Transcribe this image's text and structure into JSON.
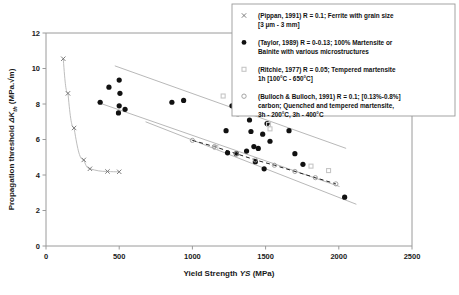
{
  "chart_data": {
    "type": "scatter",
    "title": "",
    "xlabel": "Yield Strength YS (MPa)",
    "ylabel": "Propagation threshold ΔKth (MPa.√m)",
    "xlim": [
      0,
      2500
    ],
    "ylim": [
      0,
      12
    ],
    "xticks": [
      0,
      500,
      1000,
      1500,
      2000,
      2500
    ],
    "yticks": [
      0,
      2,
      4,
      6,
      8,
      10,
      12
    ],
    "grid": false,
    "legend_position": "top-right",
    "series": [
      {
        "name": "Pippan 1991",
        "marker": "cross",
        "color": "#6f6f6f",
        "points": [
          [
            118,
            10.55
          ],
          [
            150,
            8.6
          ],
          [
            192,
            6.65
          ],
          [
            258,
            4.85
          ],
          [
            300,
            4.35
          ],
          [
            420,
            4.2
          ],
          [
            500,
            4.18
          ]
        ]
      },
      {
        "name": "Taylor 1989",
        "marker": "filled-circle",
        "color": "#111111",
        "points": [
          [
            430,
            8.95
          ],
          [
            500,
            9.35
          ],
          [
            505,
            8.6
          ],
          [
            370,
            8.1
          ],
          [
            500,
            7.9
          ],
          [
            540,
            7.7
          ],
          [
            495,
            7.5
          ],
          [
            860,
            8.1
          ],
          [
            940,
            8.2
          ],
          [
            1270,
            7.9
          ],
          [
            1310,
            7.45
          ],
          [
            1390,
            7.1
          ],
          [
            1230,
            6.5
          ],
          [
            1400,
            6.45
          ],
          [
            1480,
            6.3
          ],
          [
            1420,
            5.6
          ],
          [
            1450,
            5.5
          ],
          [
            1370,
            5.35
          ],
          [
            1240,
            5.25
          ],
          [
            1300,
            5.2
          ],
          [
            1430,
            4.75
          ],
          [
            1510,
            6.9
          ],
          [
            1530,
            5.9
          ],
          [
            1660,
            6.5
          ],
          [
            1700,
            5.2
          ],
          [
            1755,
            4.6
          ],
          [
            1490,
            4.35
          ],
          [
            2040,
            2.75
          ]
        ]
      },
      {
        "name": "Ritchie 1977",
        "marker": "open-square-gray",
        "color": "#c6c6c6",
        "points": [
          [
            1210,
            8.45
          ],
          [
            1520,
            6.85
          ],
          [
            1530,
            6.6
          ],
          [
            1160,
            5.55
          ],
          [
            1810,
            4.5
          ],
          [
            1930,
            4.25
          ]
        ]
      },
      {
        "name": "Bulloch & Bulloch 1991",
        "marker": "open-circle",
        "color": "#9b9b9b",
        "points": [
          [
            1000,
            5.95
          ],
          [
            1150,
            5.6
          ],
          [
            1300,
            5.2
          ],
          [
            1430,
            4.85
          ],
          [
            1560,
            4.55
          ],
          [
            1700,
            4.2
          ],
          [
            1840,
            3.85
          ],
          [
            1980,
            3.5
          ]
        ],
        "trend": "dashed"
      }
    ],
    "bands": [
      {
        "name": "upper-band-line",
        "from": [
          470,
          10.15
        ],
        "to": [
          2050,
          5.5
        ]
      },
      {
        "name": "mid-band-line",
        "from": [
          350,
          8.1
        ],
        "to": [
          2005,
          3.35
        ]
      },
      {
        "name": "lower-band-line",
        "from": [
          680,
          7.0
        ],
        "to": [
          2120,
          2.35
        ]
      }
    ],
    "pippan_curve": "steep decaying curve from (118,10.55) flattening toward (500,4.18)"
  },
  "axes": {
    "x": {
      "title_main": "Yield Strength ",
      "title_italic": "YS",
      "title_unit": " (MPa)",
      "labels": [
        "0",
        "500",
        "1000",
        "1500",
        "2000",
        "2500"
      ]
    },
    "y": {
      "title_pre": "Propagation threshold ",
      "title_italic": "ΔK",
      "title_sub": "th",
      "title_unit": " (MPa.√m)",
      "labels": [
        "0",
        "2",
        "4",
        "6",
        "8",
        "10",
        "12"
      ]
    }
  },
  "legend": {
    "entries": [
      {
        "marker": "cross",
        "line1": "(Pippan, 1991) R = 0.1; Ferrite with grain size",
        "line2": "[3 μm - 3 mm]",
        "line3": ""
      },
      {
        "marker": "filled-circle",
        "line1": "(Taylor, 1989) R = 0-0.13; 100% Martensite or",
        "line2": "Bainite with various microstructures",
        "line3": ""
      },
      {
        "marker": "gray-square",
        "line1": "(Ritchie, 1977) R = 0.05; Tempered martensite",
        "line2": "1h [100°C - 650°C]",
        "line3": ""
      },
      {
        "marker": "open-circle",
        "line1": "(Bulloch & Bulloch, 1991) R = 0.1; [0.13%-0.8%]",
        "line2": "carbon; Quenched and tempered martensite,",
        "line3": "3h - 200°C, 3h - 400°C"
      }
    ]
  }
}
